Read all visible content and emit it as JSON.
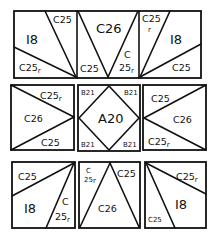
{
  "diagram": {
    "stroke_color": "#111111",
    "background": "#ffffff",
    "rows": [
      {
        "name": "top-row",
        "units": [
          {
            "name": "top-left",
            "labels": {
              "large": "I8",
              "upper": "C25",
              "lower": "C25",
              "lower_suffix": "r"
            }
          },
          {
            "name": "top-center",
            "labels": {
              "large": "C26",
              "left": "C25",
              "right_a": "C",
              "right_b": "25",
              "right_suffix": "r"
            }
          },
          {
            "name": "top-right",
            "labels": {
              "large": "I8",
              "upper_a": "C25",
              "upper_suffix": "r",
              "lower": "C25"
            }
          }
        ]
      },
      {
        "name": "middle-row",
        "units": [
          {
            "name": "middle-left",
            "labels": {
              "large": "C26",
              "upper": "C25",
              "upper_suffix": "r",
              "lower": "C25"
            }
          },
          {
            "name": "middle-center",
            "labels": {
              "center": "A20",
              "tl": "B21",
              "tr": "B21",
              "bl": "B21",
              "br": "B21"
            }
          },
          {
            "name": "middle-right",
            "labels": {
              "large": "C26",
              "upper": "C25",
              "lower": "C25",
              "lower_suffix": "r"
            }
          }
        ]
      },
      {
        "name": "bottom-row",
        "units": [
          {
            "name": "bottom-left",
            "labels": {
              "large": "I8",
              "upper": "C25",
              "right_a": "C",
              "right_b": "25",
              "right_suffix": "r"
            }
          },
          {
            "name": "bottom-center",
            "labels": {
              "large": "C26",
              "left_a": "C",
              "left_b": "25",
              "left_suffix": "r",
              "right": "C25"
            }
          },
          {
            "name": "bottom-right",
            "labels": {
              "large": "I8",
              "upper": "C25",
              "upper_suffix": "r",
              "lower": "C25"
            }
          }
        ]
      }
    ]
  }
}
